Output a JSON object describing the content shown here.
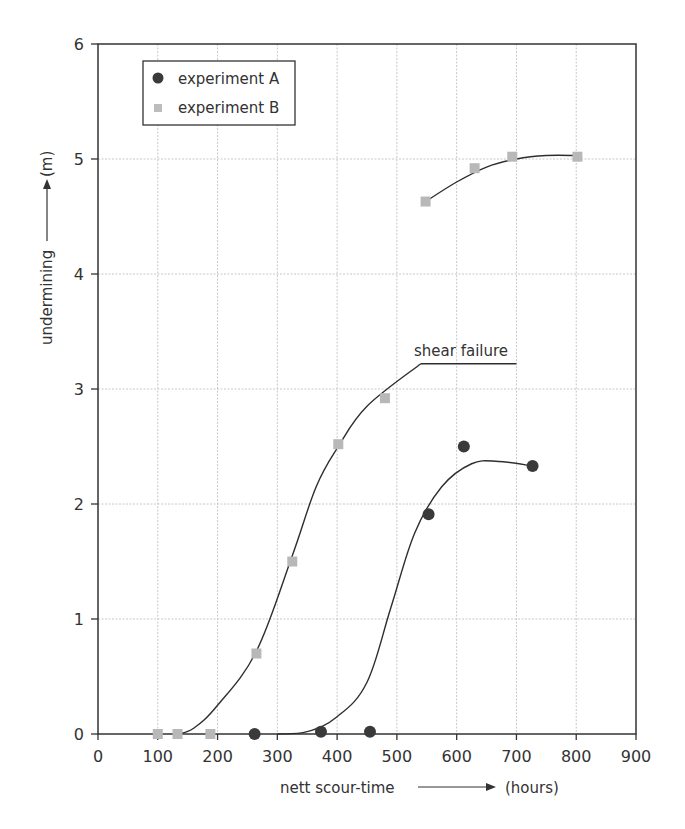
{
  "chart_data": {
    "type": "scatter",
    "title": "",
    "xlabel": "nett scour-time",
    "xunit": "(hours)",
    "ylabel": "undermining",
    "yunit": "(m)",
    "xlim": [
      0,
      900
    ],
    "ylim": [
      0,
      6
    ],
    "xticks": [
      0,
      100,
      200,
      300,
      400,
      500,
      600,
      700,
      800,
      900
    ],
    "yticks": [
      0,
      1,
      2,
      3,
      4,
      5,
      6
    ],
    "grid": true,
    "legend_position": "upper-left",
    "series": [
      {
        "name": "experiment A",
        "marker": "circle",
        "color": "#3a3a3a",
        "points": [
          [
            262,
            0
          ],
          [
            373,
            0.02
          ],
          [
            455,
            0.02
          ],
          [
            553,
            1.91
          ],
          [
            612,
            2.5
          ],
          [
            727,
            2.33
          ]
        ]
      },
      {
        "name": "experiment B",
        "marker": "square",
        "color": "#b8b8b8",
        "points": [
          [
            100,
            0
          ],
          [
            133,
            0
          ],
          [
            188,
            0
          ],
          [
            265,
            0.7
          ],
          [
            325,
            1.5
          ],
          [
            402,
            2.52
          ],
          [
            480,
            2.92
          ],
          [
            548,
            4.63
          ],
          [
            630,
            4.92
          ],
          [
            693,
            5.02
          ],
          [
            802,
            5.02
          ]
        ]
      }
    ],
    "curves": [
      {
        "name": "fit experiment B (rising)",
        "points": [
          [
            133,
            0
          ],
          [
            160,
            0.05
          ],
          [
            200,
            0.25
          ],
          [
            265,
            0.72
          ],
          [
            325,
            1.55
          ],
          [
            365,
            2.15
          ],
          [
            402,
            2.5
          ],
          [
            450,
            2.85
          ],
          [
            540,
            3.22
          ]
        ]
      },
      {
        "name": "shear failure plateau",
        "points": [
          [
            540,
            3.22
          ],
          [
            700,
            3.22
          ]
        ]
      },
      {
        "name": "fit experiment B (upper)",
        "points": [
          [
            548,
            4.63
          ],
          [
            600,
            4.8
          ],
          [
            650,
            4.93
          ],
          [
            700,
            5.0
          ],
          [
            750,
            5.03
          ],
          [
            802,
            5.03
          ]
        ]
      },
      {
        "name": "fit experiment A",
        "points": [
          [
            300,
            0
          ],
          [
            350,
            0.02
          ],
          [
            400,
            0.15
          ],
          [
            450,
            0.45
          ],
          [
            490,
            1.1
          ],
          [
            530,
            1.75
          ],
          [
            575,
            2.15
          ],
          [
            625,
            2.35
          ],
          [
            670,
            2.37
          ],
          [
            727,
            2.33
          ]
        ]
      }
    ],
    "annotations": [
      {
        "text": "shear failure",
        "x": 540,
        "y": 3.22
      }
    ]
  }
}
